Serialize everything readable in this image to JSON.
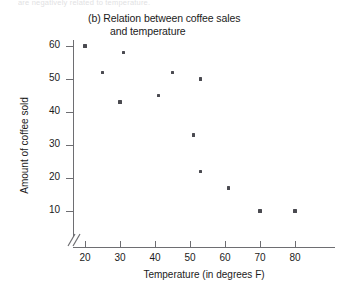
{
  "page": {
    "clipped_header_text": "are negatively related to temperature."
  },
  "chart_data": {
    "type": "scatter",
    "title": "(b) Relation between coffee sales",
    "title_line2": "and temperature",
    "xlabel": "Temperature (in degrees F)",
    "ylabel": "Amount of coffee sold",
    "xlim": [
      20,
      80
    ],
    "ylim": [
      10,
      60
    ],
    "xticks": [
      20,
      30,
      40,
      50,
      60,
      70,
      80
    ],
    "yticks": [
      10,
      20,
      30,
      40,
      50,
      60
    ],
    "grid": false,
    "legend": null,
    "axis_break": true,
    "points": [
      {
        "x": 20,
        "y": 60
      },
      {
        "x": 31,
        "y": 58
      },
      {
        "x": 25,
        "y": 52
      },
      {
        "x": 45,
        "y": 52
      },
      {
        "x": 53,
        "y": 50
      },
      {
        "x": 41,
        "y": 45
      },
      {
        "x": 30,
        "y": 43
      },
      {
        "x": 51,
        "y": 33
      },
      {
        "x": 53,
        "y": 22
      },
      {
        "x": 61,
        "y": 17
      },
      {
        "x": 70,
        "y": 10
      },
      {
        "x": 80,
        "y": 10
      }
    ]
  }
}
